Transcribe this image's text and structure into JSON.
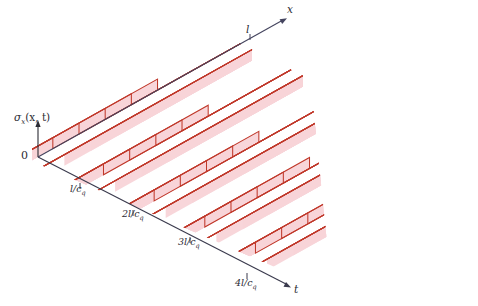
{
  "figure": {
    "title": "",
    "domain_note": "3D characteristic-plane plot of axial stress sigma_x(x,t) versus position x and time t showing a staircase (square) wave",
    "background_color": "#ffffff",
    "line_color": "#c0392b",
    "band_color": "#f8d4d8",
    "axis_color": "#3a3a4d",
    "x_axis_color": "#45455f"
  },
  "axes": {
    "vertical_label": "σ",
    "vertical_label_sub": "x",
    "vertical_label_args": "(x, t)",
    "origin_label": "0",
    "x_axis_label": "x",
    "x_axis_tick_label": "l",
    "t_axis_label": "t",
    "t_ticks": [
      {
        "label_num": "",
        "label_main": "l/c",
        "label_sub": "q",
        "full": "l/c_q"
      },
      {
        "label_num": "2",
        "label_main": "l/c",
        "label_sub": "q",
        "full": "2l/c_q"
      },
      {
        "label_num": "3",
        "label_main": "l/c",
        "label_sub": "q",
        "full": "3l/c_q"
      },
      {
        "label_num": "4",
        "label_main": "l/c",
        "label_sub": "q",
        "full": "4l/c_q"
      }
    ]
  },
  "geometry": {
    "origin": [
      38,
      157
    ],
    "x_axis_end": [
      288,
      17
    ],
    "x_axis_tick_l": [
      250,
      38
    ],
    "t_axis_end": [
      292,
      288
    ],
    "t_tick_points": [
      [
        80,
        188
      ],
      [
        133,
        215
      ],
      [
        190,
        242
      ],
      [
        247,
        278
      ]
    ]
  },
  "chart_data": {
    "type": "line",
    "xlabel": "x",
    "ylabel": "σ_x(x, t)",
    "zlabel": "t",
    "x_range_label": [
      "0",
      "l"
    ],
    "t_tick_labels": [
      "l/c_q",
      "2l/c_q",
      "3l/c_q",
      "4l/c_q"
    ],
    "grid": false,
    "legend": false,
    "series": [
      {
        "name": "characteristic-0",
        "t_index": 0,
        "base_offset": 0,
        "step_fraction": 0.62,
        "step_direction": "down",
        "step_height": 11
      },
      {
        "name": "characteristic-1",
        "t_index": 1,
        "base_offset": 1,
        "step_fraction": 0.5,
        "step_direction": "down",
        "step_height": 11
      },
      {
        "name": "characteristic-2",
        "t_index": 2,
        "base_offset": 2,
        "step_fraction": 0.38,
        "step_direction": "down",
        "step_height": 11
      },
      {
        "name": "characteristic-3",
        "t_index": 3,
        "base_offset": 3,
        "step_fraction": 0.26,
        "step_direction": "down",
        "step_height": 11
      },
      {
        "name": "characteristic-4",
        "t_index": 4,
        "base_offset": 4,
        "step_fraction": 0.14,
        "step_direction": "down",
        "step_height": 11
      }
    ],
    "bands": [
      {
        "name": "band-0",
        "t_index": 0,
        "thickness": 9
      },
      {
        "name": "band-1",
        "t_index": 1,
        "thickness": 9
      },
      {
        "name": "band-2",
        "t_index": 2,
        "thickness": 9
      },
      {
        "name": "band-3",
        "t_index": 3,
        "thickness": 9
      },
      {
        "name": "band-4",
        "t_index": 4,
        "thickness": 9
      }
    ]
  }
}
